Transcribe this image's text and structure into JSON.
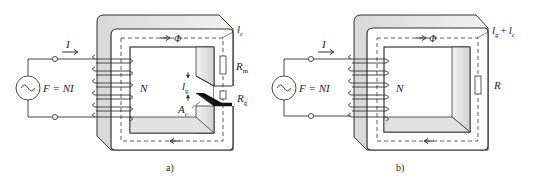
{
  "figure": {
    "panels": [
      {
        "id": "a",
        "caption": "a)",
        "source_label": "F = NI",
        "current_label": "I",
        "turns_label": "N",
        "flux_label": "Φ",
        "core_length_label": "l",
        "core_length_sub": "c",
        "core_resistance_label": "R",
        "core_resistance_sub": "m",
        "gap_length_label": "l",
        "gap_length_sub": "g",
        "gap_resistance_label": "R",
        "gap_resistance_sub": "g",
        "area_label": "A",
        "area_sub": "c"
      },
      {
        "id": "b",
        "caption": "b)",
        "source_label": "F = NI",
        "current_label": "I",
        "turns_label": "N",
        "flux_label": "Φ",
        "path_label_1": "l",
        "path_label_1_sub": "g",
        "path_plus": "+",
        "path_label_2": "l",
        "path_label_2_sub": "c",
        "resistance_label": "R"
      }
    ],
    "colors": {
      "line": "#333333",
      "core_front": "#ffffff",
      "core_side": "#e6e6e6",
      "gap_fill": "#111111"
    }
  }
}
